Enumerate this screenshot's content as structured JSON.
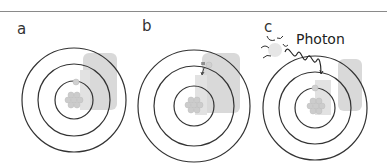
{
  "diagram": {
    "panels": [
      {
        "label": "a",
        "description": "Electron in inner orbit (ground state)",
        "orbits": 3,
        "electron_orbit": 1
      },
      {
        "label": "b",
        "description": "Electron jumps to a higher orbit",
        "orbits": 3,
        "electron_orbit": 2
      },
      {
        "label": "c",
        "description": "Photon emitted/absorbed as wavy line from sun-like source",
        "orbits": 3,
        "electron_orbit": 1,
        "annotation": "Photon"
      }
    ],
    "colors": {
      "orbit_stroke": "#333333",
      "shadow_block": "#d9d9d9",
      "nucleus": "#cfcfcf",
      "rule": "#8a8a8a"
    }
  }
}
